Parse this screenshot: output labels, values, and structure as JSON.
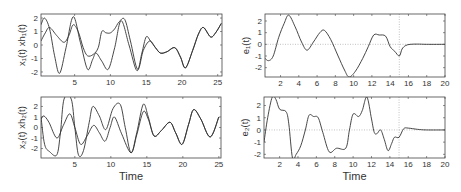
{
  "figure": {
    "background": "#ffffff",
    "line_color": "#333333",
    "guide_color": "#999999"
  },
  "chart_data": [
    {
      "id": "x1",
      "type": "line",
      "title": "",
      "xlabel": "",
      "ylabel": "x₁(t) xh₁(t)",
      "xlim": [
        0.3,
        25.6
      ],
      "ylim": [
        -2.3,
        2.3
      ],
      "xticks": [
        5,
        10,
        15,
        20,
        25
      ],
      "yticks": [
        -2,
        -1,
        0,
        1,
        2
      ],
      "grid": false,
      "frame": {
        "x0": 41,
        "y0": 14,
        "x1": 222,
        "y1": 76
      },
      "series": [
        {
          "name": "x₁(t)",
          "points": [
            [
              0.3,
              1.5
            ],
            [
              0.8,
              2.0
            ],
            [
              1.5,
              1.2
            ],
            [
              2.2,
              -0.8
            ],
            [
              2.9,
              -2.1
            ],
            [
              3.8,
              -0.2
            ],
            [
              4.8,
              2.1
            ],
            [
              5.8,
              0.2
            ],
            [
              6.8,
              -1.8
            ],
            [
              7.5,
              -1.1
            ],
            [
              8.0,
              -0.6
            ],
            [
              8.8,
              -1.2
            ],
            [
              9.7,
              -1.8
            ],
            [
              10.6,
              -0.2
            ],
            [
              11.5,
              1.8
            ],
            [
              12.6,
              0.0
            ],
            [
              13.7,
              -1.9
            ],
            [
              14.4,
              -0.6
            ],
            [
              15.0,
              0.6
            ],
            [
              15.6,
              0.3
            ],
            [
              16.3,
              -0.2
            ],
            [
              17.0,
              -0.6
            ],
            [
              17.9,
              -0.5
            ],
            [
              19.0,
              -0.2
            ],
            [
              19.8,
              -0.9
            ],
            [
              20.5,
              -1.7
            ],
            [
              21.5,
              -0.4
            ],
            [
              22.3,
              0.8
            ],
            [
              23.0,
              1.3
            ],
            [
              24.0,
              0.6
            ],
            [
              24.7,
              0.9
            ],
            [
              25.5,
              1.6
            ]
          ]
        },
        {
          "name": "xh₁(t)",
          "points": [
            [
              0.3,
              0.3
            ],
            [
              0.9,
              0.9
            ],
            [
              1.5,
              1.3
            ],
            [
              2.5,
              0.7
            ],
            [
              3.5,
              0.2
            ],
            [
              4.2,
              0.7
            ],
            [
              4.8,
              1.5
            ],
            [
              5.5,
              1.0
            ],
            [
              6.2,
              -0.2
            ],
            [
              6.8,
              -0.8
            ],
            [
              7.6,
              -0.7
            ],
            [
              8.3,
              -0.2
            ],
            [
              8.8,
              1.0
            ],
            [
              9.4,
              0.9
            ],
            [
              10.0,
              0.9
            ],
            [
              10.6,
              1.2
            ],
            [
              11.2,
              1.7
            ],
            [
              12.0,
              1.9
            ],
            [
              12.8,
              0.3
            ],
            [
              13.8,
              -1.8
            ],
            [
              14.6,
              -0.4
            ],
            [
              15.5,
              0.3
            ],
            [
              16.3,
              -0.2
            ],
            [
              17.0,
              -0.6
            ],
            [
              17.9,
              -0.5
            ],
            [
              19.0,
              -0.2
            ],
            [
              19.8,
              -0.9
            ],
            [
              20.5,
              -1.7
            ],
            [
              21.5,
              -0.4
            ],
            [
              22.3,
              0.8
            ],
            [
              23.0,
              1.3
            ],
            [
              24.0,
              0.6
            ],
            [
              24.7,
              0.9
            ],
            [
              25.5,
              1.6
            ]
          ]
        }
      ]
    },
    {
      "id": "x2",
      "type": "line",
      "title": "",
      "xlabel": "Time",
      "ylabel": "x₂(t) xh₂(t)",
      "xlim": [
        0.3,
        25.3
      ],
      "ylim": [
        -2.9,
        2.9
      ],
      "xticks": [
        5,
        10,
        15,
        20,
        25
      ],
      "yticks": [
        -2,
        -1,
        0,
        1,
        2
      ],
      "grid": false,
      "frame": {
        "x0": 41,
        "y0": 97,
        "x1": 221,
        "y1": 158
      },
      "series": [
        {
          "name": "x₂(t)",
          "points": [
            [
              0.3,
              1.0
            ],
            [
              0.8,
              -1.6
            ],
            [
              1.5,
              -2.3
            ],
            [
              2.5,
              -2.6
            ],
            [
              3.0,
              -0.5
            ],
            [
              3.5,
              2.7
            ],
            [
              4.5,
              2.7
            ],
            [
              5.0,
              0.0
            ],
            [
              5.5,
              -2.6
            ],
            [
              6.2,
              -2.2
            ],
            [
              7.0,
              0.5
            ],
            [
              7.5,
              2.0
            ],
            [
              8.4,
              1.1
            ],
            [
              9.3,
              -0.2
            ],
            [
              10.3,
              1.8
            ],
            [
              11.3,
              2.2
            ],
            [
              12.0,
              0.0
            ],
            [
              12.8,
              -2.4
            ],
            [
              13.6,
              -0.5
            ],
            [
              14.5,
              2.2
            ],
            [
              15.2,
              1.0
            ],
            [
              16.0,
              -0.8
            ],
            [
              17.0,
              -0.3
            ],
            [
              18.2,
              0.5
            ],
            [
              19.0,
              -0.5
            ],
            [
              19.9,
              -1.6
            ],
            [
              20.8,
              0.3
            ],
            [
              21.5,
              1.7
            ],
            [
              22.5,
              0.8
            ],
            [
              23.8,
              -0.9
            ],
            [
              25.0,
              1.0
            ]
          ]
        },
        {
          "name": "xh₂(t)",
          "points": [
            [
              0.3,
              0.8
            ],
            [
              0.7,
              1.1
            ],
            [
              1.4,
              0.5
            ],
            [
              2.5,
              -1.0
            ],
            [
              3.4,
              0.2
            ],
            [
              4.3,
              1.3
            ],
            [
              5.0,
              0.0
            ],
            [
              5.8,
              -1.6
            ],
            [
              6.7,
              -0.8
            ],
            [
              7.6,
              0.2
            ],
            [
              8.4,
              -0.5
            ],
            [
              9.2,
              -1.3
            ],
            [
              9.9,
              0.0
            ],
            [
              10.5,
              1.0
            ],
            [
              11.5,
              -0.6
            ],
            [
              12.8,
              -2.4
            ],
            [
              13.6,
              -0.7
            ],
            [
              14.5,
              1.5
            ],
            [
              15.2,
              0.8
            ],
            [
              16.0,
              -0.8
            ],
            [
              17.0,
              -0.3
            ],
            [
              18.2,
              0.5
            ],
            [
              19.0,
              -0.5
            ],
            [
              19.9,
              -1.6
            ],
            [
              20.8,
              0.3
            ],
            [
              21.5,
              1.7
            ],
            [
              22.5,
              0.8
            ],
            [
              23.8,
              -0.9
            ],
            [
              25.0,
              1.0
            ]
          ]
        }
      ]
    },
    {
      "id": "e1",
      "type": "line",
      "title": "",
      "xlabel": "",
      "ylabel": "e₁(t)",
      "xlim": [
        0.3,
        20
      ],
      "ylim": [
        -2.8,
        2.6
      ],
      "xticks": [
        2,
        4,
        6,
        8,
        10,
        12,
        14,
        16,
        18,
        20
      ],
      "yticks": [
        -2,
        -1,
        0,
        1,
        2
      ],
      "grid": false,
      "reference_lines": {
        "y": 0,
        "x": 15
      },
      "frame": {
        "x0": 265,
        "y0": 14,
        "x1": 445,
        "y1": 77
      },
      "series": [
        {
          "name": "e₁(t)",
          "points": [
            [
              0.3,
              -1.2
            ],
            [
              0.7,
              -1.4
            ],
            [
              1.2,
              -1.0
            ],
            [
              1.8,
              0.6
            ],
            [
              2.4,
              1.8
            ],
            [
              2.9,
              2.5
            ],
            [
              3.6,
              1.5
            ],
            [
              4.3,
              0.2
            ],
            [
              4.9,
              -0.5
            ],
            [
              5.6,
              0.2
            ],
            [
              6.3,
              1.0
            ],
            [
              6.8,
              1.2
            ],
            [
              7.5,
              0.4
            ],
            [
              8.3,
              -1.0
            ],
            [
              9.0,
              -2.2
            ],
            [
              9.5,
              -2.8
            ],
            [
              10.2,
              -2.3
            ],
            [
              11.0,
              -1.2
            ],
            [
              11.6,
              -0.2
            ],
            [
              12.2,
              0.8
            ],
            [
              12.8,
              0.8
            ],
            [
              13.5,
              0.7
            ],
            [
              14.0,
              -0.2
            ],
            [
              14.5,
              -0.6
            ],
            [
              15.0,
              -1.0
            ],
            [
              15.3,
              -0.4
            ],
            [
              15.7,
              -0.1
            ],
            [
              16.2,
              0.0
            ],
            [
              17.0,
              0.02
            ],
            [
              18.0,
              0.0
            ],
            [
              20.0,
              0.0
            ]
          ]
        }
      ]
    },
    {
      "id": "e2",
      "type": "line",
      "title": "",
      "xlabel": "Time",
      "ylabel": "e₂(t)",
      "xlim": [
        0.3,
        20
      ],
      "ylim": [
        -2.3,
        2.7
      ],
      "xticks": [
        2,
        4,
        6,
        8,
        10,
        12,
        14,
        16,
        18,
        20
      ],
      "yticks": [
        -2,
        -1,
        0,
        1,
        2
      ],
      "grid": false,
      "reference_lines": {
        "y": 0,
        "x": 15
      },
      "frame": {
        "x0": 264,
        "y0": 97,
        "x1": 445,
        "y1": 158
      },
      "series": [
        {
          "name": "e₂(t)",
          "points": [
            [
              0.3,
              -1.0
            ],
            [
              0.7,
              1.0
            ],
            [
              1.2,
              2.7
            ],
            [
              1.6,
              2.5
            ],
            [
              2.0,
              1.7
            ],
            [
              2.7,
              1.5
            ],
            [
              3.0,
              0.5
            ],
            [
              3.4,
              -2.3
            ],
            [
              3.8,
              -2.0
            ],
            [
              4.3,
              -1.3
            ],
            [
              4.8,
              0.0
            ],
            [
              5.2,
              1.2
            ],
            [
              5.7,
              1.1
            ],
            [
              6.2,
              1.0
            ],
            [
              6.7,
              -0.2
            ],
            [
              7.4,
              -1.8
            ],
            [
              8.2,
              -1.5
            ],
            [
              9.2,
              -1.5
            ],
            [
              9.6,
              0.0
            ],
            [
              10.0,
              1.3
            ],
            [
              10.6,
              1.1
            ],
            [
              11.0,
              1.6
            ],
            [
              11.5,
              2.7
            ],
            [
              12.0,
              0.9
            ],
            [
              12.3,
              -0.2
            ],
            [
              12.6,
              -0.3
            ],
            [
              13.0,
              0.0
            ],
            [
              13.4,
              -0.8
            ],
            [
              13.8,
              -1.7
            ],
            [
              14.2,
              -1.1
            ],
            [
              14.5,
              -0.6
            ],
            [
              15.0,
              -0.6
            ],
            [
              15.5,
              0.1
            ],
            [
              16.0,
              0.15
            ],
            [
              17.0,
              0.05
            ],
            [
              18.0,
              0.0
            ],
            [
              20.0,
              0.0
            ]
          ]
        }
      ]
    }
  ]
}
